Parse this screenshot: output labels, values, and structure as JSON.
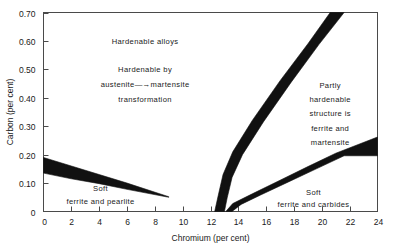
{
  "chart_data": {
    "type": "line",
    "title": "",
    "subtitle": "",
    "xlabel": "Chromium (per cent)",
    "ylabel": "Carbon (per cent)",
    "xlim": [
      0,
      24
    ],
    "ylim": [
      0,
      0.7
    ],
    "xticks": [
      0,
      2,
      4,
      6,
      8,
      10,
      12,
      14,
      16,
      18,
      20,
      22,
      24
    ],
    "xtick_labels": [
      "0",
      "2",
      "4",
      "6",
      "8",
      "10",
      "12",
      "14",
      "16",
      "18",
      "20",
      "22",
      "24"
    ],
    "yticks": [
      0,
      0.1,
      0.2,
      0.3,
      0.4,
      0.5,
      0.6,
      0.7
    ],
    "ytick_labels": [
      "0",
      "0.10",
      "0.20",
      "0.30",
      "0.40",
      "0.50",
      "0.60",
      "0.70"
    ],
    "grid": false,
    "legend": "none",
    "band_color": "#111111",
    "axis_color": "#4a4a4a",
    "bands": [
      {
        "name": "soft-ferrite-pearlite-boundary",
        "description": "Wedge band descending from left axis, separating soft ferrite and pearlite from hardenable alloys",
        "upper": [
          [
            0,
            0.19
          ],
          [
            2,
            0.16
          ],
          [
            4,
            0.13
          ],
          [
            6,
            0.1
          ],
          [
            9,
            0.052
          ]
        ],
        "lower": [
          [
            0,
            0.135
          ],
          [
            2,
            0.115
          ],
          [
            4,
            0.098
          ],
          [
            6,
            0.078
          ],
          [
            9,
            0.05
          ]
        ]
      },
      {
        "name": "hardenable-martensite-boundary",
        "description": "Steep band rising from x about 12.3 to the top edge, right limit of fully hardenable austenite to martensite region",
        "upper": [
          [
            12.3,
            0.0
          ],
          [
            12.55,
            0.055
          ],
          [
            12.9,
            0.13
          ],
          [
            13.6,
            0.21
          ],
          [
            15.0,
            0.32
          ],
          [
            17.0,
            0.46
          ],
          [
            19.0,
            0.59
          ],
          [
            20.6,
            0.7
          ]
        ],
        "lower": [
          [
            13.0,
            0.0
          ],
          [
            13.2,
            0.048
          ],
          [
            13.55,
            0.12
          ],
          [
            14.3,
            0.2
          ],
          [
            15.8,
            0.315
          ],
          [
            17.8,
            0.455
          ],
          [
            19.8,
            0.588
          ],
          [
            21.6,
            0.7
          ]
        ]
      },
      {
        "name": "soft-ferrite-carbides-boundary",
        "description": "Shallow band rising from x about 13.2 to the right edge, separating soft ferrite and carbides from partly hardenable structure",
        "upper": [
          [
            13.1,
            0.0
          ],
          [
            13.6,
            0.028
          ],
          [
            15.0,
            0.062
          ],
          [
            17.0,
            0.11
          ],
          [
            19.0,
            0.158
          ],
          [
            21.0,
            0.205
          ],
          [
            24.0,
            0.262
          ]
        ],
        "lower": [
          [
            13.55,
            0.0
          ],
          [
            14.2,
            0.025
          ],
          [
            15.6,
            0.058
          ],
          [
            17.6,
            0.104
          ],
          [
            19.6,
            0.15
          ],
          [
            21.6,
            0.196
          ],
          [
            24.0,
            0.196
          ]
        ]
      }
    ],
    "annotations": [
      {
        "name": "hardenable-alloys-label",
        "text": "Hardenable alloys",
        "x": 7.3,
        "y": 0.6
      },
      {
        "name": "hardenable-by-label",
        "text": "Hardenable by",
        "x": 7.3,
        "y": 0.5
      },
      {
        "name": "austenite-martensite-label",
        "text": "austenite—→martensite",
        "x": 7.3,
        "y": 0.447
      },
      {
        "name": "transformation-label",
        "text": "transformation",
        "x": 7.3,
        "y": 0.394
      },
      {
        "name": "partly-hardenable-line-1",
        "text": "Partly",
        "x": 20.6,
        "y": 0.445
      },
      {
        "name": "partly-hardenable-line-2",
        "text": "hardenable",
        "x": 20.6,
        "y": 0.395
      },
      {
        "name": "partly-hardenable-line-3",
        "text": "structure is",
        "x": 20.6,
        "y": 0.345
      },
      {
        "name": "partly-hardenable-line-4",
        "text": "ferrite and",
        "x": 20.6,
        "y": 0.295
      },
      {
        "name": "partly-hardenable-line-5",
        "text": "martensite",
        "x": 20.6,
        "y": 0.245
      },
      {
        "name": "soft-ferrite-pearlite-line-1",
        "text": "Soft",
        "x": 4.1,
        "y": 0.082
      },
      {
        "name": "soft-ferrite-pearlite-line-2",
        "text": "ferrite and pearlite",
        "x": 4.1,
        "y": 0.038
      },
      {
        "name": "soft-ferrite-carbides-line-1",
        "text": "Soft",
        "x": 19.4,
        "y": 0.07
      },
      {
        "name": "soft-ferrite-carbides-line-2",
        "text": "ferrite and carbides",
        "x": 19.4,
        "y": 0.028
      }
    ]
  }
}
